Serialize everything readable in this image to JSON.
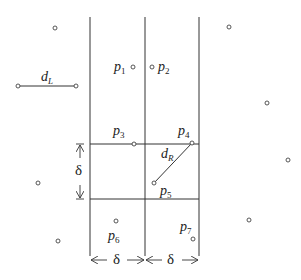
{
  "diagram": {
    "title": "",
    "colors": {
      "line": "#333333",
      "point": "#444444",
      "background": "#ffffff"
    },
    "strip": {
      "vertical_lines_x": [
        90,
        145,
        199
      ],
      "horizontal_lines_y": [
        144,
        199
      ],
      "top_y": 17,
      "bottom_y": 256
    },
    "labels": {
      "p1": {
        "base": "p",
        "sub": "1"
      },
      "p2": {
        "base": "p",
        "sub": "2"
      },
      "p3": {
        "base": "p",
        "sub": "3"
      },
      "p4": {
        "base": "p",
        "sub": "4"
      },
      "p5": {
        "base": "p",
        "sub": "5"
      },
      "p6": {
        "base": "p",
        "sub": "6"
      },
      "p7": {
        "base": "p",
        "sub": "7"
      },
      "dL": {
        "base": "d",
        "sub": "L"
      },
      "dR": {
        "base": "d",
        "sub": "R"
      },
      "delta_vertical": "δ",
      "delta_left": "δ",
      "delta_right": "δ"
    },
    "points": [
      {
        "name": "unlabeled",
        "x": 55,
        "y": 28
      },
      {
        "name": "p1",
        "x": 133,
        "y": 67
      },
      {
        "name": "p2",
        "x": 152,
        "y": 67
      },
      {
        "name": "dL-start",
        "x": 18,
        "y": 86
      },
      {
        "name": "dL-end",
        "x": 76,
        "y": 86
      },
      {
        "name": "unlabeled",
        "x": 229,
        "y": 27
      },
      {
        "name": "unlabeled",
        "x": 267,
        "y": 103
      },
      {
        "name": "p3",
        "x": 134,
        "y": 144
      },
      {
        "name": "p4",
        "x": 192,
        "y": 143
      },
      {
        "name": "p5",
        "x": 154,
        "y": 183
      },
      {
        "name": "unlabeled",
        "x": 288,
        "y": 160
      },
      {
        "name": "unlabeled",
        "x": 38,
        "y": 183
      },
      {
        "name": "p6",
        "x": 116,
        "y": 221
      },
      {
        "name": "unlabeled",
        "x": 249,
        "y": 220
      },
      {
        "name": "p7",
        "x": 193,
        "y": 239
      },
      {
        "name": "unlabeled",
        "x": 58,
        "y": 241
      }
    ]
  }
}
